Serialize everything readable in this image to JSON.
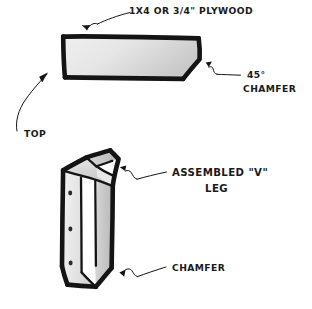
{
  "drawing": {
    "title": "Hand-drawn woodworking detail: chamfered board and assembled V leg",
    "background_color": "#ffffff",
    "ink_color": "#141414"
  },
  "annotations": {
    "plywood_label": "1X4 OR 3/4\" PLYWOOD",
    "chamfer_angle_label": "45°",
    "chamfer_label_top": "CHAMFER",
    "top_label": "TOP",
    "assembled_leg_label_line1": "ASSEMBLED \"V\"",
    "assembled_leg_label_line2": "LEG",
    "chamfer_label_bottom": "CHAMFER"
  },
  "parts": {
    "board": {
      "name": "single board blank",
      "fill_light": "#ececec",
      "fill_dark": "#cfcfcf",
      "outline_color": "#141414",
      "chamfer_angle_degrees": 45,
      "stock_options": [
        "1X4",
        "3/4\" PLYWOOD"
      ]
    },
    "v_leg": {
      "name": "assembled V leg",
      "face_fill_light": "#f0f0f0",
      "face_fill_mid": "#d9d9d9",
      "face_fill_dark": "#b8b8b8",
      "screw_dot_count": 3,
      "has_bottom_chamfer": true,
      "has_top_chamfer": true
    }
  }
}
